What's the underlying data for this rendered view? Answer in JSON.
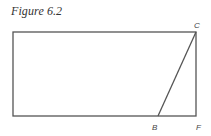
{
  "figure": {
    "caption": "Figure 6.2",
    "stroke_color": "#555555",
    "rectangle": {
      "top_left": [
        13,
        32
      ],
      "top_right": [
        196,
        32
      ],
      "bottom_right": [
        196,
        116
      ],
      "bottom_left": [
        13,
        116
      ]
    },
    "segment_BC": {
      "from": "B",
      "to": "C"
    },
    "points": [
      {
        "name": "C",
        "label": "C",
        "x": 196,
        "y": 32
      },
      {
        "name": "B",
        "label": "B",
        "x": 158,
        "y": 116
      },
      {
        "name": "F",
        "label": "F",
        "x": 196,
        "y": 116
      }
    ]
  }
}
